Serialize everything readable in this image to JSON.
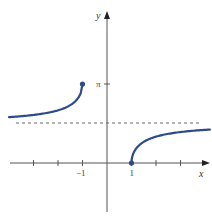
{
  "chart_data": {
    "type": "line",
    "title": "",
    "function": "y = arcsec(x)",
    "xlabel": "x",
    "ylabel": "y",
    "x_tick_labels": [
      {
        "value": -1,
        "label": "−1"
      },
      {
        "value": 1,
        "label": "1"
      }
    ],
    "y_tick_labels": [
      {
        "value": 3.14159,
        "label": "π"
      }
    ],
    "x_ticks": [
      -3,
      -2,
      -1,
      1,
      2,
      3
    ],
    "xlim": [
      -4.0,
      4.2
    ],
    "ylim": [
      -2.0,
      4.9
    ],
    "asymptote": {
      "type": "horizontal",
      "y": 1.5708,
      "label": "y = π/2",
      "style": "dashed"
    },
    "series": [
      {
        "name": "left branch",
        "x": [
          -4.0,
          -3.5,
          -3.0,
          -2.5,
          -2.0,
          -1.5,
          -1.25,
          -1.1,
          -1.0
        ],
        "y": [
          1.8235,
          1.8605,
          1.9106,
          1.9823,
          2.0944,
          2.3005,
          2.4981,
          2.7141,
          3.1416
        ],
        "endpoint": {
          "x": -1,
          "y": 3.1416,
          "marker": "filled-dot"
        }
      },
      {
        "name": "right branch",
        "x": [
          1.0,
          1.1,
          1.25,
          1.5,
          2.0,
          2.5,
          3.0,
          3.5,
          4.0,
          4.2
        ],
        "y": [
          0.0,
          0.4275,
          0.6435,
          0.8411,
          1.0472,
          1.1593,
          1.231,
          1.281,
          1.3181,
          1.3261
        ],
        "endpoint": {
          "x": 1,
          "y": 0,
          "marker": "filled-dot"
        }
      }
    ],
    "colors": {
      "curve": "#2c4a8c",
      "axis": "#555555",
      "asymptote": "#666666"
    },
    "grid": false,
    "legend": null
  },
  "labels": {
    "x_axis": "x",
    "y_axis": "y",
    "pi": "π",
    "neg_one": "−1",
    "one": "1"
  }
}
